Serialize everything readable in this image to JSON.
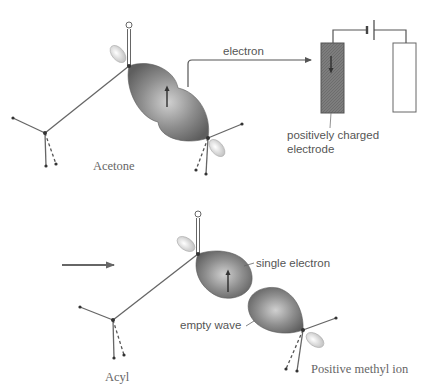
{
  "labels": {
    "electron": "electron",
    "positive_electrode_line1": "positively charged",
    "positive_electrode_line2": "electrode",
    "acetone": "Acetone",
    "single_electron": "single electron",
    "empty_wave": "empty wave",
    "acyl": "Acyl",
    "positive_methyl_ion": "Positive methyl ion"
  },
  "colors": {
    "lobe_dark": "#6e6e6e",
    "lobe_light": "#c8c8c8",
    "small_lobe": "#e6e6e6",
    "electrode_dark": "#7a7a7a",
    "electrode_light": "#ffffff",
    "line": "#666666",
    "text": "#555555"
  },
  "icons": {
    "spin_up_arrow": "arrow-up",
    "electron_flow_arrow": "arrow-right",
    "reaction_arrow": "arrow-right",
    "electrode_arrow": "arrow-down",
    "battery": "battery-symbol"
  }
}
